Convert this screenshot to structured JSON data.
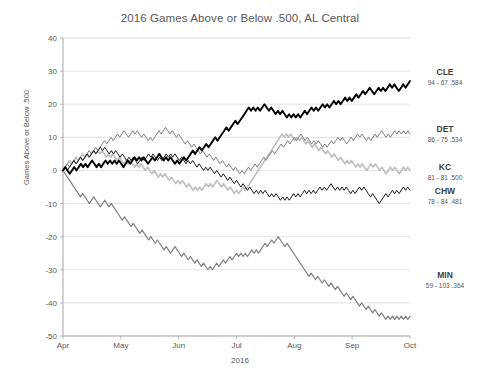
{
  "chart_data": {
    "type": "line",
    "title": "2016 Games Above or Below .500, AL Central",
    "xlabel": "2016",
    "ylabel": "Games Above or Below .500",
    "ylim": [
      -50,
      40
    ],
    "yticks": [
      40,
      30,
      20,
      10,
      0,
      -10,
      -20,
      -30,
      -40,
      -50
    ],
    "ytick_labels": [
      "40",
      "30",
      "20",
      "10",
      "0",
      "-10",
      "-20",
      "-30",
      "-40",
      "-50"
    ],
    "xticks": [
      "Apr",
      "May",
      "Jun",
      "Jul",
      "Aug",
      "Sep",
      "Oct"
    ],
    "grid": true,
    "legend_position": "right",
    "series": [
      {
        "name": "CLE",
        "label": "CLE",
        "record": "94 - 67  .584",
        "wins": 94,
        "losses": 67,
        "pct": ".584",
        "color": "#000000",
        "width": 1.9,
        "final_value": 27,
        "values": [
          0,
          1,
          0,
          -1,
          0,
          1,
          0,
          1,
          2,
          1,
          2,
          1,
          2,
          3,
          2,
          1,
          2,
          1,
          2,
          3,
          2,
          3,
          2,
          3,
          2,
          3,
          2,
          1,
          2,
          3,
          2,
          3,
          4,
          3,
          4,
          3,
          4,
          3,
          2,
          3,
          4,
          3,
          4,
          5,
          4,
          3,
          4,
          3,
          4,
          3,
          2,
          3,
          2,
          3,
          4,
          3,
          4,
          5,
          6,
          5,
          6,
          7,
          6,
          7,
          8,
          7,
          8,
          9,
          10,
          9,
          10,
          11,
          12,
          13,
          12,
          13,
          14,
          15,
          14,
          15,
          16,
          17,
          18,
          19,
          18,
          19,
          18,
          19,
          18,
          19,
          20,
          19,
          18,
          19,
          18,
          17,
          18,
          17,
          18,
          17,
          16,
          17,
          16,
          17,
          16,
          17,
          16,
          17,
          18,
          17,
          18,
          19,
          18,
          19,
          18,
          19,
          20,
          19,
          20,
          19,
          20,
          21,
          20,
          21,
          20,
          21,
          22,
          21,
          22,
          21,
          22,
          23,
          22,
          23,
          24,
          23,
          24,
          25,
          24,
          23,
          24,
          25,
          24,
          25,
          24,
          25,
          26,
          25,
          26,
          25,
          24,
          25,
          26,
          25,
          26,
          27
        ]
      },
      {
        "name": "DET",
        "label": "DET",
        "record": "86 - 75  .534",
        "wins": 86,
        "losses": 75,
        "pct": ".534",
        "color": "#7f7f7f",
        "width": 1.0,
        "final_value": 11,
        "values": [
          0,
          1,
          2,
          1,
          2,
          3,
          2,
          3,
          4,
          3,
          4,
          5,
          6,
          5,
          6,
          7,
          6,
          7,
          8,
          9,
          8,
          9,
          10,
          9,
          10,
          11,
          10,
          11,
          12,
          11,
          10,
          11,
          12,
          11,
          12,
          11,
          10,
          11,
          10,
          9,
          10,
          9,
          10,
          11,
          12,
          11,
          12,
          13,
          12,
          11,
          12,
          11,
          10,
          11,
          10,
          9,
          8,
          9,
          8,
          7,
          8,
          7,
          6,
          5,
          6,
          5,
          4,
          5,
          4,
          3,
          4,
          3,
          2,
          3,
          2,
          1,
          2,
          1,
          0,
          1,
          0,
          -1,
          0,
          -1,
          0,
          1,
          0,
          1,
          2,
          1,
          2,
          3,
          4,
          3,
          4,
          5,
          6,
          5,
          6,
          7,
          8,
          7,
          8,
          9,
          8,
          9,
          10,
          9,
          10,
          11,
          10,
          9,
          10,
          9,
          8,
          9,
          8,
          9,
          8,
          7,
          8,
          7,
          8,
          9,
          8,
          9,
          10,
          9,
          10,
          9,
          8,
          9,
          10,
          9,
          10,
          11,
          10,
          11,
          10,
          9,
          10,
          9,
          10,
          11,
          10,
          11,
          12,
          11,
          10,
          11,
          10,
          11,
          12,
          11,
          12,
          11,
          12,
          11,
          12,
          11
        ]
      },
      {
        "name": "KC",
        "label": "KC",
        "record": "81 - 81  .500",
        "wins": 81,
        "losses": 81,
        "pct": ".500",
        "color": "#bfbfbf",
        "width": 1.6,
        "final_value": 0,
        "values": [
          0,
          1,
          2,
          3,
          2,
          3,
          4,
          3,
          4,
          5,
          4,
          5,
          4,
          5,
          6,
          5,
          6,
          5,
          6,
          5,
          4,
          5,
          4,
          5,
          4,
          3,
          4,
          3,
          2,
          3,
          2,
          3,
          2,
          1,
          2,
          1,
          2,
          1,
          0,
          1,
          0,
          -1,
          0,
          -1,
          -2,
          -1,
          -2,
          -1,
          -2,
          -3,
          -2,
          -3,
          -4,
          -3,
          -4,
          -3,
          -4,
          -5,
          -4,
          -5,
          -6,
          -5,
          -6,
          -5,
          -6,
          -5,
          -4,
          -5,
          -4,
          -5,
          -4,
          -3,
          -4,
          -5,
          -4,
          -5,
          -6,
          -5,
          -6,
          -7,
          -6,
          -7,
          -6,
          -5,
          -6,
          -5,
          -4,
          -3,
          -2,
          -1,
          0,
          1,
          2,
          3,
          4,
          5,
          6,
          7,
          8,
          9,
          10,
          11,
          10,
          11,
          10,
          11,
          10,
          9,
          10,
          9,
          10,
          9,
          8,
          9,
          8,
          7,
          8,
          7,
          6,
          7,
          6,
          5,
          6,
          5,
          4,
          5,
          4,
          3,
          4,
          3,
          2,
          3,
          2,
          3,
          2,
          1,
          2,
          1,
          2,
          1,
          0,
          1,
          2,
          1,
          2,
          1,
          0,
          1,
          0,
          -1,
          0,
          1,
          0,
          1,
          0,
          -1,
          0,
          1,
          0,
          1,
          0
        ]
      },
      {
        "name": "CHW",
        "label": "CHW",
        "record": "78 - 84  .481",
        "wins": 78,
        "losses": 84,
        "pct": ".481",
        "color": "#1a1a1a",
        "width": 1.0,
        "final_value": -6,
        "values": [
          0,
          1,
          0,
          1,
          2,
          3,
          2,
          3,
          4,
          3,
          4,
          5,
          4,
          5,
          6,
          5,
          6,
          7,
          6,
          7,
          6,
          5,
          6,
          5,
          6,
          5,
          4,
          5,
          4,
          3,
          4,
          3,
          4,
          3,
          2,
          3,
          4,
          3,
          4,
          5,
          4,
          5,
          4,
          3,
          4,
          3,
          4,
          5,
          4,
          5,
          4,
          5,
          4,
          3,
          4,
          3,
          2,
          3,
          2,
          3,
          2,
          1,
          2,
          1,
          0,
          1,
          0,
          1,
          0,
          -1,
          0,
          -1,
          -2,
          -1,
          -2,
          -3,
          -2,
          -3,
          -4,
          -3,
          -4,
          -5,
          -4,
          -5,
          -6,
          -5,
          -6,
          -7,
          -6,
          -7,
          -6,
          -7,
          -6,
          -7,
          -8,
          -7,
          -8,
          -7,
          -8,
          -9,
          -8,
          -9,
          -8,
          -9,
          -8,
          -7,
          -8,
          -7,
          -8,
          -7,
          -6,
          -7,
          -6,
          -7,
          -6,
          -7,
          -6,
          -5,
          -6,
          -5,
          -6,
          -5,
          -4,
          -5,
          -6,
          -5,
          -6,
          -5,
          -6,
          -5,
          -6,
          -7,
          -6,
          -7,
          -6,
          -5,
          -6,
          -5,
          -6,
          -7,
          -8,
          -7,
          -8,
          -9,
          -10,
          -9,
          -8,
          -7,
          -8,
          -7,
          -6,
          -7,
          -6,
          -7,
          -6,
          -5,
          -6,
          -5,
          -6
        ]
      },
      {
        "name": "MIN",
        "label": "MIN",
        "record": "59 - 103  .364",
        "wins": 59,
        "losses": 103,
        "pct": ".364",
        "color": "#808080",
        "width": 1.2,
        "final_value": -44,
        "values": [
          0,
          -1,
          -2,
          -3,
          -4,
          -5,
          -6,
          -7,
          -8,
          -7,
          -8,
          -9,
          -10,
          -9,
          -8,
          -9,
          -10,
          -11,
          -10,
          -9,
          -10,
          -11,
          -10,
          -11,
          -12,
          -13,
          -14,
          -15,
          -14,
          -15,
          -16,
          -17,
          -16,
          -17,
          -18,
          -19,
          -18,
          -19,
          -20,
          -21,
          -20,
          -21,
          -22,
          -21,
          -22,
          -23,
          -24,
          -23,
          -24,
          -25,
          -24,
          -23,
          -24,
          -25,
          -26,
          -25,
          -26,
          -27,
          -26,
          -27,
          -28,
          -27,
          -28,
          -29,
          -28,
          -29,
          -30,
          -29,
          -30,
          -29,
          -28,
          -29,
          -28,
          -27,
          -28,
          -27,
          -26,
          -27,
          -26,
          -25,
          -26,
          -25,
          -26,
          -25,
          -26,
          -25,
          -24,
          -25,
          -24,
          -25,
          -24,
          -23,
          -22,
          -23,
          -22,
          -21,
          -22,
          -21,
          -20,
          -21,
          -22,
          -23,
          -22,
          -23,
          -24,
          -25,
          -26,
          -27,
          -28,
          -29,
          -30,
          -31,
          -32,
          -31,
          -32,
          -33,
          -32,
          -33,
          -34,
          -33,
          -34,
          -35,
          -34,
          -35,
          -36,
          -35,
          -36,
          -37,
          -38,
          -37,
          -38,
          -39,
          -38,
          -39,
          -40,
          -41,
          -40,
          -41,
          -42,
          -41,
          -42,
          -43,
          -42,
          -43,
          -44,
          -43,
          -44,
          -45,
          -44,
          -45,
          -44,
          -45,
          -44,
          -45,
          -44,
          -45,
          -44,
          -45,
          -44
        ]
      }
    ]
  }
}
